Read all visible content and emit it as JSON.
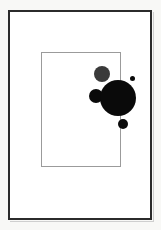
{
  "artwork": {
    "title": "Framed Abstract Circle Composition",
    "caption": "",
    "canvas": {
      "width": 161,
      "height": 230,
      "background_color": "#f8f8f6"
    },
    "outer_frame": {
      "name": "outer-border",
      "x": 8,
      "y": 10,
      "width": 144,
      "height": 210,
      "border_width": 2,
      "border_color": "#2b2b2b",
      "fill_color": "#ffffff"
    },
    "inner_rect": {
      "name": "inner-rectangle",
      "x": 41,
      "y": 52,
      "width": 80,
      "height": 115,
      "border_width": 1,
      "border_color": "#9b9b9b",
      "fill_color": "transparent"
    },
    "shapes": [
      {
        "name": "circle-gray-upper",
        "shape": "circle",
        "cx": 102,
        "cy": 74,
        "r": 8,
        "color": "#3a3a3a"
      },
      {
        "name": "circle-black-left-bump",
        "shape": "circle",
        "cx": 96,
        "cy": 96,
        "r": 7,
        "color": "#0a0a0a"
      },
      {
        "name": "circle-black-large",
        "shape": "circle",
        "cx": 118,
        "cy": 98,
        "r": 18,
        "color": "#0a0a0a"
      },
      {
        "name": "circle-black-lower-small",
        "shape": "circle",
        "cx": 123,
        "cy": 124,
        "r": 5,
        "color": "#0a0a0a"
      },
      {
        "name": "dot-black-tiny",
        "shape": "circle",
        "cx": 132,
        "cy": 78,
        "r": 2.5,
        "color": "#0a0a0a"
      }
    ]
  },
  "chart_data": {
    "type": "scatter",
    "xlabel": "",
    "ylabel": "",
    "xlim": [
      0,
      161
    ],
    "ylim": [
      0,
      230
    ],
    "grid": false,
    "legend": "none",
    "annotations": [
      "outer dark rectangular frame",
      "inner thin gray rectangle",
      "cluster of overlapping filled circles straddling inner rectangle right edge"
    ],
    "points": [
      {
        "label": "circle-gray-upper",
        "x": 102,
        "y": 74,
        "size": 8,
        "color": "#3a3a3a"
      },
      {
        "label": "circle-black-left-bump",
        "x": 96,
        "y": 96,
        "size": 7,
        "color": "#0a0a0a"
      },
      {
        "label": "circle-black-large",
        "x": 118,
        "y": 98,
        "size": 18,
        "color": "#0a0a0a"
      },
      {
        "label": "circle-black-lower-small",
        "x": 123,
        "y": 124,
        "size": 5,
        "color": "#0a0a0a"
      },
      {
        "label": "dot-black-tiny",
        "x": 132,
        "y": 78,
        "size": 2.5,
        "color": "#0a0a0a"
      }
    ]
  }
}
